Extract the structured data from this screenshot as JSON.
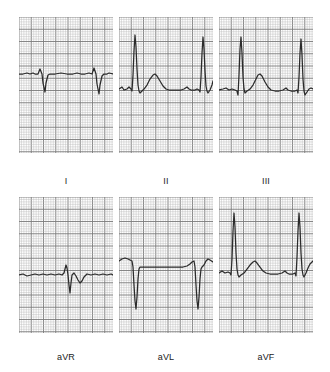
{
  "figure": {
    "background_color": "#ffffff",
    "trace_color": "#2b2b2b",
    "grid_fine_color": "#b9b9b9",
    "grid_bold_color": "#7a7a7a",
    "grid_small_box_px": 2.45,
    "grid_large_box_px": 12.25
  },
  "layout": {
    "columns": 3,
    "rows": 2,
    "panel_width": 94,
    "panel_height": 136,
    "row1_top": 17,
    "row2_top": 197,
    "col_lefts": [
      19,
      119,
      219
    ]
  },
  "panels": [
    {
      "id": "lead-i",
      "label": "I",
      "row": 1,
      "col": 1,
      "label_x": 66,
      "label_y": 176,
      "baseline_y": 74,
      "beats": [
        {
          "r_peak_y": 69,
          "s_trough_y": 92,
          "x": 22
        },
        {
          "r_peak_y": 69,
          "s_trough_y": 94,
          "x": 76
        }
      ],
      "description": "Small r wave with deep S wave, flat isoelectric baseline, low-amplitude T",
      "points": "0,57 4,57 8,56 11,57 14,56 16,57 19,57 21,52 23,57 24,66 26,75 27,66 29,58 31,57 36,57 42,56 48,57 54,57 58,56 62,57 66,57 70,56 73,57 75,51 77,57 78,67 80,77 81,68 83,59 85,57 88,57 90,56 94,57"
    },
    {
      "id": "lead-ii",
      "label": "II",
      "row": 1,
      "col": 2,
      "label_x": 166,
      "label_y": 176,
      "baseline_y": 89,
      "beats": [
        {
          "r_peak_y": 31,
          "x": 14
        },
        {
          "r_peak_y": 31,
          "x": 82
        }
      ],
      "description": "Tall upright R waves, visible P waves and broad upright T waves",
      "points": "0,72 3,70 5,73 8,72 10,70 12,72 13,74 14,58 15,34 16,18 17,30 18,52 19,68 20,74 21,76 23,74 25,72 28,68 31,62 34,58 36,57 38,59 41,64 44,69 47,72 50,73 54,73 58,73 62,73 65,72 68,70 70,72 72,73 76,73 78,72 80,73 81,75 82,60 83,36 84,20 85,32 86,54 87,69 88,74 89,76 91,73 93,68 94,64"
    },
    {
      "id": "lead-iii",
      "label": "III",
      "row": 1,
      "col": 3,
      "label_x": 266,
      "label_y": 176,
      "baseline_y": 90,
      "beats": [
        {
          "r_peak_y": 33,
          "x": 20
        },
        {
          "r_peak_y": 33,
          "x": 80
        }
      ],
      "description": "Tall R waves with small q, prominent rounded T wave between beats",
      "points": "0,73 4,72 7,71 10,73 13,72 16,73 18,74 19,78 20,58 21,32 22,20 23,36 24,60 25,72 26,76 28,74 31,72 34,68 37,62 39,58 41,57 43,59 46,65 49,70 52,73 56,74 60,74 64,73 67,71 69,73 72,74 76,74 78,73 79,76 80,60 81,36 82,22 83,38 84,62 85,74 86,78 88,75 90,72 92,71 94,72"
    },
    {
      "id": "lead-avr",
      "label": "aVR",
      "row": 2,
      "col": 1,
      "label_x": 66,
      "label_y": 352,
      "baseline_y": 272,
      "beats": [
        {
          "r_peak_y": 66,
          "s_trough_y": 92,
          "x": 48
        }
      ],
      "description": "Low-amplitude complex, small R then sharp deep S, inverted T wave",
      "points": "0,78 4,77 8,79 12,78 16,77 20,78 24,77 28,78 32,77 36,78 40,77 43,78 45,76 46,72 47,68 48,71 49,78 50,88 51,96 52,86 53,78 55,76 57,79 59,83 61,86 63,84 65,80 68,77 72,78 76,77 80,78 84,77 88,78 92,77 94,78"
    },
    {
      "id": "lead-avl",
      "label": "aVL",
      "row": 2,
      "col": 2,
      "label_x": 166,
      "label_y": 352,
      "baseline_y": 268,
      "beats": [
        {
          "s_trough_y": 112,
          "x": 14
        },
        {
          "s_trough_y": 112,
          "x": 76
        }
      ],
      "description": "Dominant deep negative S waves with small preceding r, flat depressed baseline",
      "points": "0,64 3,62 6,61 9,62 11,63 13,64 14,70 15,88 16,104 17,112 18,100 19,82 20,72 21,70 23,70 26,70 30,70 35,70 40,70 45,70 50,70 55,70 60,70 64,70 68,69 71,67 73,65 75,64 76,70 77,88 78,104 79,112 80,100 81,82 82,72 83,70 85,68 87,64 89,62 91,63 94,65"
    },
    {
      "id": "lead-avf",
      "label": "aVF",
      "row": 2,
      "col": 3,
      "label_x": 266,
      "label_y": 352,
      "baseline_y": 272,
      "beats": [
        {
          "r_peak_y": 18,
          "x": 14
        },
        {
          "r_peak_y": 18,
          "x": 78
        }
      ],
      "description": "Very tall R waves with P waves and rounded T waves, small q notch",
      "points": "0,76 3,74 6,76 9,75 11,76 12,78 13,62 14,34 15,16 16,30 17,56 18,72 19,78 20,80 22,78 25,76 28,72 31,68 34,65 36,64 38,66 41,70 44,74 47,76 51,77 55,77 59,77 63,76 66,74 68,76 70,77 74,77 76,76 77,79 78,60 79,34 80,16 81,30 82,56 83,72 84,78 85,80 87,76 89,71 91,67 93,65 94,64"
    }
  ]
}
